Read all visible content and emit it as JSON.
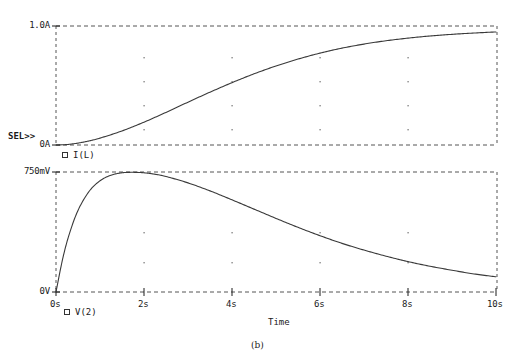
{
  "figure": {
    "caption": "(b)",
    "background_color": "#ffffff",
    "trace_color": "#3a3a3a",
    "grid_color": "#555555"
  },
  "upper_plot": {
    "selected_marker": "SEL>>",
    "y_ticks": [
      {
        "label": "1.0A",
        "value": 1.0
      },
      {
        "label": "0A",
        "value": 0.0
      }
    ],
    "legend": {
      "marker": "square-marker",
      "label": "I(L)"
    }
  },
  "lower_plot": {
    "y_ticks": [
      {
        "label": "750mV",
        "value": 0.75
      },
      {
        "label": "0V",
        "value": 0.0
      }
    ],
    "legend": {
      "marker": "square-marker",
      "label": "V(2)"
    },
    "x_axis_title": "Time",
    "x_ticks": [
      {
        "label": "0s",
        "value": 0
      },
      {
        "label": "2s",
        "value": 2
      },
      {
        "label": "4s",
        "value": 4
      },
      {
        "label": "6s",
        "value": 6
      },
      {
        "label": "8s",
        "value": 8
      },
      {
        "label": "10s",
        "value": 10
      }
    ]
  },
  "chart_data": {
    "type": "line",
    "title": "",
    "subtitle": "(b)",
    "xlabel": "Time",
    "xlim": [
      0,
      10
    ],
    "grid": true,
    "legend_position": "below-each-plot",
    "panels": [
      {
        "name": "upper",
        "ylabel": "",
        "ylim": [
          0,
          1.0
        ],
        "ytick_labels": [
          "1.0A",
          "0A"
        ],
        "ytick_values": [
          1.0,
          0.0
        ],
        "selected": true,
        "series": [
          {
            "name": "I(L)",
            "units": "A",
            "x": [
              0,
              0.25,
              0.5,
              0.75,
              1.0,
              1.5,
              2.0,
              2.5,
              3.0,
              3.5,
              4.0,
              4.5,
              5.0,
              5.5,
              6.0,
              6.5,
              7.0,
              7.5,
              8.0,
              8.5,
              9.0,
              9.5,
              10.0
            ],
            "y": [
              0.0,
              0.004,
              0.016,
              0.034,
              0.058,
              0.118,
              0.192,
              0.274,
              0.36,
              0.444,
              0.524,
              0.598,
              0.664,
              0.722,
              0.772,
              0.814,
              0.848,
              0.876,
              0.898,
              0.916,
              0.93,
              0.941,
              0.95
            ]
          }
        ]
      },
      {
        "name": "lower",
        "ylabel": "",
        "ylim": [
          0,
          0.75
        ],
        "ytick_labels": [
          "750mV",
          "0V"
        ],
        "ytick_values": [
          0.75,
          0.0
        ],
        "selected": false,
        "series": [
          {
            "name": "V(2)",
            "units": "V",
            "x": [
              0,
              0.15,
              0.3,
              0.5,
              0.75,
              1.0,
              1.25,
              1.5,
              1.75,
              2.0,
              2.25,
              2.5,
              3.0,
              3.5,
              4.0,
              4.5,
              5.0,
              5.5,
              6.0,
              6.5,
              7.0,
              7.5,
              8.0,
              8.5,
              9.0,
              9.5,
              10.0
            ],
            "y": [
              0.0,
              0.205,
              0.36,
              0.51,
              0.628,
              0.695,
              0.73,
              0.745,
              0.748,
              0.745,
              0.736,
              0.722,
              0.682,
              0.632,
              0.576,
              0.518,
              0.46,
              0.404,
              0.352,
              0.304,
              0.262,
              0.224,
              0.19,
              0.161,
              0.136,
              0.113,
              0.095
            ]
          }
        ]
      }
    ]
  }
}
